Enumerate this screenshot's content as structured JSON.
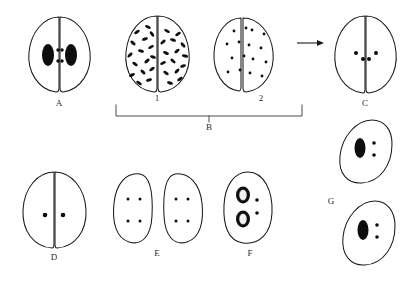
{
  "figure": {
    "background_color": "#ffffff",
    "stroke_color": "#1a1a1a",
    "fill_color": "#0d0d0d"
  },
  "panels": {
    "A": {
      "label": "A",
      "label_x": 59,
      "label_y": 104,
      "description": "Paired cells, each lobe with one large dark nucleus and two small dots toward midline",
      "type": "paired-lobes",
      "lobes": 2,
      "large_nuclei_per_lobe": 1,
      "small_dots_per_lobe": 2
    },
    "B1": {
      "label": "1",
      "label_x": 157,
      "label_y": 99,
      "description": "Paired cells densely filled with dark comma-shaped granules",
      "type": "paired-lobes",
      "lobes": 2,
      "granules_per_lobe": 14
    },
    "B2": {
      "label": "2",
      "label_x": 261,
      "label_y": 99,
      "description": "Paired cells with sparse small round dots",
      "type": "paired-lobes",
      "lobes": 2,
      "dots_per_lobe": 8
    },
    "B": {
      "label": "B",
      "label_x": 209,
      "label_y": 124,
      "description": "Bracket grouping stages 1 and 2"
    },
    "C": {
      "label": "C",
      "label_x": 365,
      "label_y": 104,
      "description": "Paired cells with two small dots per lobe near the midline",
      "type": "paired-lobes",
      "lobes": 2,
      "small_dots_per_lobe": 2
    },
    "D": {
      "label": "D",
      "label_x": 54,
      "label_y": 258,
      "description": "Paired cells, one small dot per lobe at center",
      "type": "paired-lobes",
      "lobes": 2,
      "small_dots_per_lobe": 1
    },
    "E": {
      "label": "E",
      "label_x": 157,
      "label_y": 254,
      "description": "Two separated cells, each with four small dots in a 2x2 arrangement",
      "type": "separated-lobes",
      "lobes": 2,
      "small_dots_per_lobe": 4
    },
    "F": {
      "label": "F",
      "label_x": 250,
      "label_y": 254,
      "description": "Single cell with two ring-shaped nuclei and two small dots",
      "type": "single-cell",
      "ring_nuclei": 2,
      "small_dots": 2
    },
    "G": {
      "label": "G",
      "label_x": 331,
      "label_y": 202,
      "description": "Two separate single cells, each with a large dark nucleus and two small dots",
      "type": "two-single-cells",
      "cells": 2,
      "large_nuclei_per_cell": 1,
      "small_dots_per_cell": 2
    }
  },
  "connector": {
    "arrow": {
      "name": "arrow-right",
      "from_panel": "2",
      "to_panel": "C",
      "x1": 297,
      "x2": 323,
      "y": 43
    }
  }
}
